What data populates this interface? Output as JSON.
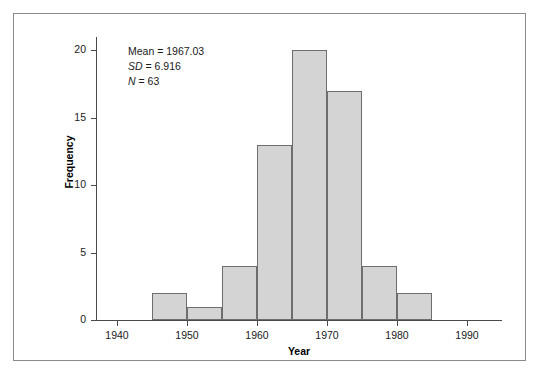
{
  "figure": {
    "frame_border_color": "#8a8a8a",
    "background_color": "#ffffff"
  },
  "annotation": {
    "mean_label": "Mean = 1967.03",
    "sd_symbol": "SD",
    "sd_value": " = 6.916",
    "n_symbol": "N",
    "n_value": " = 63"
  },
  "chart_data": {
    "type": "bar",
    "title": "",
    "xlabel": "Year",
    "ylabel": "Frequency",
    "xlim": [
      1937,
      1995
    ],
    "ylim": [
      0,
      21
    ],
    "grid": false,
    "legend": "none",
    "bar_color": "#d4d4d4",
    "bar_edge_color": "#6e6e6e",
    "bin_width": 5,
    "xticks": [
      1940,
      1950,
      1960,
      1970,
      1980,
      1990
    ],
    "xtick_labels": [
      "1940",
      "1950",
      "1960",
      "1970",
      "1980",
      "1990"
    ],
    "yticks": [
      0,
      5,
      10,
      15,
      20
    ],
    "ytick_labels": [
      "0",
      "5",
      "10",
      "15",
      "20"
    ],
    "bins": [
      {
        "start": 1945,
        "end": 1950,
        "value": 2
      },
      {
        "start": 1950,
        "end": 1955,
        "value": 1
      },
      {
        "start": 1955,
        "end": 1960,
        "value": 4
      },
      {
        "start": 1960,
        "end": 1965,
        "value": 13
      },
      {
        "start": 1965,
        "end": 1970,
        "value": 20
      },
      {
        "start": 1970,
        "end": 1975,
        "value": 17
      },
      {
        "start": 1975,
        "end": 1980,
        "value": 4
      },
      {
        "start": 1980,
        "end": 1985,
        "value": 2
      }
    ],
    "categories": [
      "1945-1950",
      "1950-1955",
      "1955-1960",
      "1960-1965",
      "1965-1970",
      "1970-1975",
      "1975-1980",
      "1980-1985"
    ],
    "values": [
      2,
      1,
      4,
      13,
      20,
      17,
      4,
      2
    ],
    "total_n": 63,
    "mean": 1967.03,
    "sd": 6.916
  }
}
